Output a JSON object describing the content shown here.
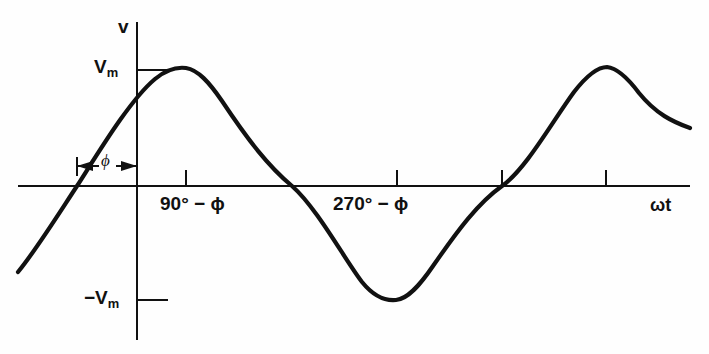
{
  "figure": {
    "kind": "sinusoidal-waveform-plot",
    "background_color": "#fefefe",
    "ink_color": "#111111"
  },
  "axes": {
    "vertical_axis_label": "v",
    "horizontal_axis_label": "ωt",
    "origin_px": {
      "x": 137,
      "y": 186
    },
    "vertical_axis_px": {
      "x": 137,
      "y_top": 22,
      "y_bottom": 340
    },
    "horizontal_axis_px": {
      "y": 186,
      "x_left": 18,
      "x_right": 690
    },
    "y_ticks": [
      {
        "label": "V",
        "sub": "m",
        "value": 1,
        "y_px": 70,
        "side": "right"
      },
      {
        "label": "−V",
        "sub": "m",
        "value": -1,
        "y_px": 300,
        "side": "right"
      }
    ],
    "x_ticks": [
      {
        "label": "90° − ϕ",
        "x_px": 186
      },
      {
        "label": "270° − ϕ",
        "x_px": 397
      },
      {
        "label": "",
        "x_px": 502
      },
      {
        "label": "",
        "x_px": 606
      }
    ]
  },
  "annotation": {
    "phase_dimension": {
      "symbol": "ϕ",
      "y_px": 166,
      "x_start_px": 77,
      "x_end_px": 137,
      "left_arrow": true,
      "right_arrow": true,
      "end_caps": true
    }
  },
  "labels": {
    "v": "v",
    "vm_main": "V",
    "vm_sub": "m",
    "neg_vm_main": "−V",
    "neg_vm_sub": "m",
    "phi": "ϕ",
    "tick_90": "90° − ϕ",
    "tick_270": "270° − ϕ",
    "omega_t": "ωt"
  },
  "chart_data": {
    "type": "line",
    "title": "",
    "xlabel": "ωt",
    "ylabel": "v",
    "grid": false,
    "legend": null,
    "equation": "v = Vm sin(ωt + ϕ)",
    "amplitude": 1,
    "amplitude_label": "Vm",
    "phase_shift_label": "ϕ",
    "xlim_px": [
      18,
      690
    ],
    "ylim": [
      -1,
      1
    ],
    "series": [
      {
        "name": "v = Vm sin(ωt + ϕ)",
        "color": "#111111",
        "linewidth_px": 4.2,
        "key_points_px": [
          {
            "x": 18,
            "y": 270,
            "note": "left end of curve"
          },
          {
            "x": 77,
            "y": 186,
            "note": "rising zero crossing (−ϕ)"
          },
          {
            "x": 186,
            "y": 68,
            "note": "positive peak Vm at 90° − ϕ"
          },
          {
            "x": 292,
            "y": 186,
            "note": "falling zero crossing (180° − ϕ)"
          },
          {
            "x": 397,
            "y": 300,
            "note": "negative peak −Vm at 270° − ϕ"
          },
          {
            "x": 502,
            "y": 186,
            "note": "rising zero crossing (360° − ϕ)"
          },
          {
            "x": 607,
            "y": 67,
            "note": "second positive peak Vm"
          },
          {
            "x": 690,
            "y": 128,
            "note": "right end of curve"
          }
        ],
        "path_d": "M 18 272 C 36 250 56 218 77 186 C 100 150 130 100 155 79 C 167 69 178 67 186 68 C 198 70 209 82 222 101 C 248 140 268 166 292 186 C 317 208 345 260 362 282 C 375 298 386 301 396 300 C 408 299 420 285 433 266 C 458 230 478 203 502 186 C 526 169 552 122 574 92 C 588 74 598 67 607 67 C 617 68 627 77 639 93 C 656 114 673 122 690 128"
      }
    ]
  }
}
